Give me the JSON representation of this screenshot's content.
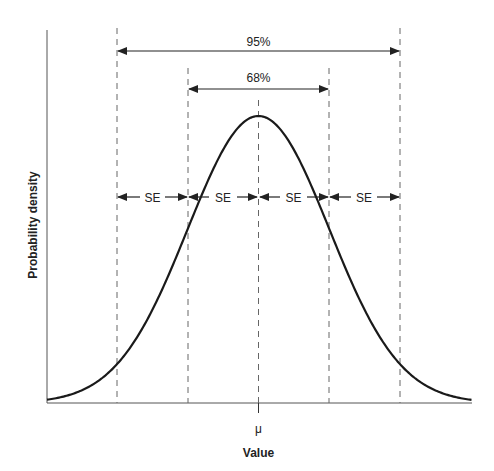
{
  "chart_data": {
    "type": "line",
    "title": "",
    "xlabel": "Value",
    "ylabel": "Probability density",
    "x_tick_labels": [
      "μ"
    ],
    "distribution": "normal",
    "mean_label": "μ",
    "x_sd_units": [
      -2,
      -1,
      0,
      1,
      2
    ],
    "annotations": {
      "interval_95": "95%",
      "interval_68": "68%",
      "se_segments": [
        "SE",
        "SE",
        "SE",
        "SE"
      ]
    },
    "grid": false,
    "legend": null
  },
  "labels": {
    "pct95": "95%",
    "pct68": "68%",
    "se1": "SE",
    "se2": "SE",
    "se3": "SE",
    "se4": "SE",
    "mu": "μ",
    "xlabel": "Value",
    "ylabel": "Probability density"
  },
  "colors": {
    "curve": "#1a1a1a",
    "axis": "#555555",
    "dash": "#666666",
    "text": "#222222"
  }
}
